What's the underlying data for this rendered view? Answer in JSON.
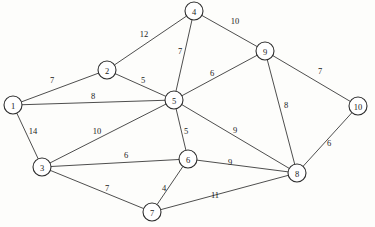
{
  "chart_data": {
    "type": "diagram",
    "subtype": "weighted-undirected-graph",
    "title": "",
    "nodes": [
      {
        "id": "1",
        "label": "1",
        "x": 13,
        "y": 105
      },
      {
        "id": "2",
        "label": "2",
        "x": 107,
        "y": 70
      },
      {
        "id": "3",
        "label": "3",
        "x": 42,
        "y": 167
      },
      {
        "id": "4",
        "label": "4",
        "x": 194,
        "y": 11
      },
      {
        "id": "5",
        "label": "5",
        "x": 174,
        "y": 100
      },
      {
        "id": "6",
        "label": "6",
        "x": 188,
        "y": 159
      },
      {
        "id": "7",
        "label": "7",
        "x": 152,
        "y": 212
      },
      {
        "id": "8",
        "label": "8",
        "x": 297,
        "y": 173
      },
      {
        "id": "9",
        "label": "9",
        "x": 265,
        "y": 51
      },
      {
        "id": "10",
        "label": "10",
        "x": 358,
        "y": 106
      }
    ],
    "node_radius": 9,
    "edges": [
      {
        "source": "1",
        "target": "2",
        "weight": 7,
        "label": "7",
        "lx": 52,
        "ly": 80
      },
      {
        "source": "1",
        "target": "5",
        "weight": 8,
        "label": "8",
        "lx": 93,
        "ly": 96
      },
      {
        "source": "1",
        "target": "3",
        "weight": 14,
        "label": "14",
        "lx": 33,
        "ly": 131
      },
      {
        "source": "2",
        "target": "4",
        "weight": 12,
        "label": "12",
        "lx": 144,
        "ly": 34
      },
      {
        "source": "2",
        "target": "5",
        "weight": 5,
        "label": "5",
        "lx": 143,
        "ly": 80
      },
      {
        "source": "3",
        "target": "5",
        "weight": 10,
        "label": "10",
        "lx": 97,
        "ly": 131
      },
      {
        "source": "3",
        "target": "6",
        "weight": 6,
        "label": "6",
        "lx": 126,
        "ly": 155
      },
      {
        "source": "3",
        "target": "7",
        "weight": 7,
        "label": "7",
        "lx": 107,
        "ly": 188
      },
      {
        "source": "4",
        "target": "5",
        "weight": 7,
        "label": "7",
        "lx": 180,
        "ly": 51
      },
      {
        "source": "4",
        "target": "9",
        "weight": 10,
        "label": "10",
        "lx": 235,
        "ly": 21
      },
      {
        "source": "5",
        "target": "6",
        "weight": 5,
        "label": "5",
        "lx": 186,
        "ly": 131
      },
      {
        "source": "5",
        "target": "8",
        "weight": 9,
        "label": "9",
        "lx": 235,
        "ly": 130
      },
      {
        "source": "5",
        "target": "9",
        "weight": 6,
        "label": "6",
        "lx": 212,
        "ly": 73
      },
      {
        "source": "6",
        "target": "7",
        "weight": 4,
        "label": "4",
        "lx": 164,
        "ly": 188
      },
      {
        "source": "6",
        "target": "8",
        "weight": 9,
        "label": "9",
        "lx": 230,
        "ly": 162
      },
      {
        "source": "7",
        "target": "8",
        "weight": 11,
        "label": "11",
        "lx": 215,
        "ly": 195
      },
      {
        "source": "8",
        "target": "9",
        "weight": 8,
        "label": "8",
        "lx": 286,
        "ly": 105
      },
      {
        "source": "8",
        "target": "10",
        "weight": 6,
        "label": "6",
        "lx": 329,
        "ly": 143
      },
      {
        "source": "9",
        "target": "10",
        "weight": 7,
        "label": "7",
        "lx": 320,
        "ly": 71
      }
    ],
    "colors": {
      "node_fill": "#ffffff",
      "node_stroke": "#2e2e2e",
      "edge_stroke": "#3a3a3a",
      "label_text": "#1a1a1a",
      "background": "#fdfdfb"
    },
    "layout": {
      "width": 375,
      "height": 227,
      "grid": false,
      "legend": false,
      "directed": false
    }
  }
}
